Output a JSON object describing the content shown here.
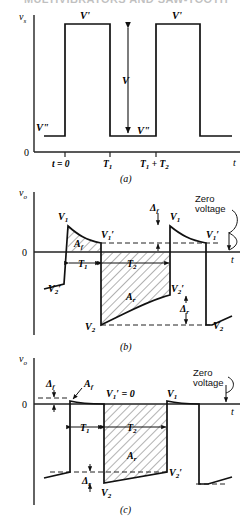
{
  "figure": {
    "clipped_header": "MULTIVIBRATORS AND SAW-TOOTH",
    "panels": [
      {
        "id": "a",
        "caption": "(a)",
        "y_axis_label": "v",
        "y_axis_sub": "s",
        "x_axis_label": "t",
        "origin_label": "0",
        "x_ticks": [
          "t = 0",
          "T",
          "T"
        ],
        "tick_labels": {
          "t0": "t = 0",
          "t1_base": "T",
          "t1_sub": "1",
          "t2_expr_base1": "T",
          "t2_expr_sub1": "1",
          "t2_expr_plus": " + ",
          "t2_expr_base2": "T",
          "t2_expr_sub2": "2"
        },
        "level_labels": {
          "high_left": "V'",
          "high_right": "V'",
          "low_left": "V\"",
          "low_mid": "V\"",
          "amplitude": "V"
        }
      },
      {
        "id": "b",
        "caption": "(b)",
        "y_axis_label": "v",
        "y_axis_sub": "o",
        "x_axis_label": "t",
        "origin_label": "0",
        "annotations": {
          "zero_voltage": "Zero voltage",
          "area_forward": "A",
          "area_forward_sub": "f",
          "area_reverse": "A",
          "area_reverse_sub": "r",
          "t1": "T",
          "t1_sub": "1",
          "t2": "T",
          "t2_sub": "2",
          "delta_f": "Δ",
          "delta_f_sub": "f",
          "delta_r": "Δ",
          "delta_r_sub": "r",
          "v1_left": "V",
          "v1_left_sub": "1",
          "v1p_left": "V",
          "v1p_left_sub": "1",
          "v1p_left_prime": "′",
          "v1_right": "V",
          "v1_right_sub": "1",
          "v1p_right": "V",
          "v1p_right_sub": "1",
          "v1p_right_prime": "′",
          "v2p_left": "V",
          "v2p_left_sub": "2",
          "v2p_left_prime": "′",
          "v2p_right": "V",
          "v2p_right_sub": "2",
          "v2p_right_prime": "′",
          "v2_left": "V",
          "v2_left_sub": "2",
          "v2_right": "V",
          "v2_right_sub": "2"
        }
      },
      {
        "id": "c",
        "caption": "(c)",
        "y_axis_label": "v",
        "y_axis_sub": "o",
        "x_axis_label": "t",
        "origin_label": "0",
        "annotations": {
          "zero_voltage": "Zero voltage",
          "area_forward": "A",
          "area_forward_sub": "f",
          "area_reverse": "A",
          "area_reverse_sub": "r",
          "t1": "T",
          "t1_sub": "1",
          "t2": "T",
          "t2_sub": "2",
          "delta_f": "Δ",
          "delta_f_sub": "f",
          "delta_r": "Δ",
          "delta_r_sub": "r",
          "v1p_zero_base": "V",
          "v1p_zero_sub": "1",
          "v1p_zero_rest": "′ = 0",
          "v1_right": "V",
          "v1_right_sub": "1",
          "v2p": "V",
          "v2p_sub": "2",
          "v2p_prime": "′",
          "v2": "V",
          "v2_sub": "2"
        }
      }
    ],
    "colors": {
      "ink": "#111111",
      "axis": "#222222",
      "hatch": "#555555",
      "background": "#ffffff"
    }
  }
}
